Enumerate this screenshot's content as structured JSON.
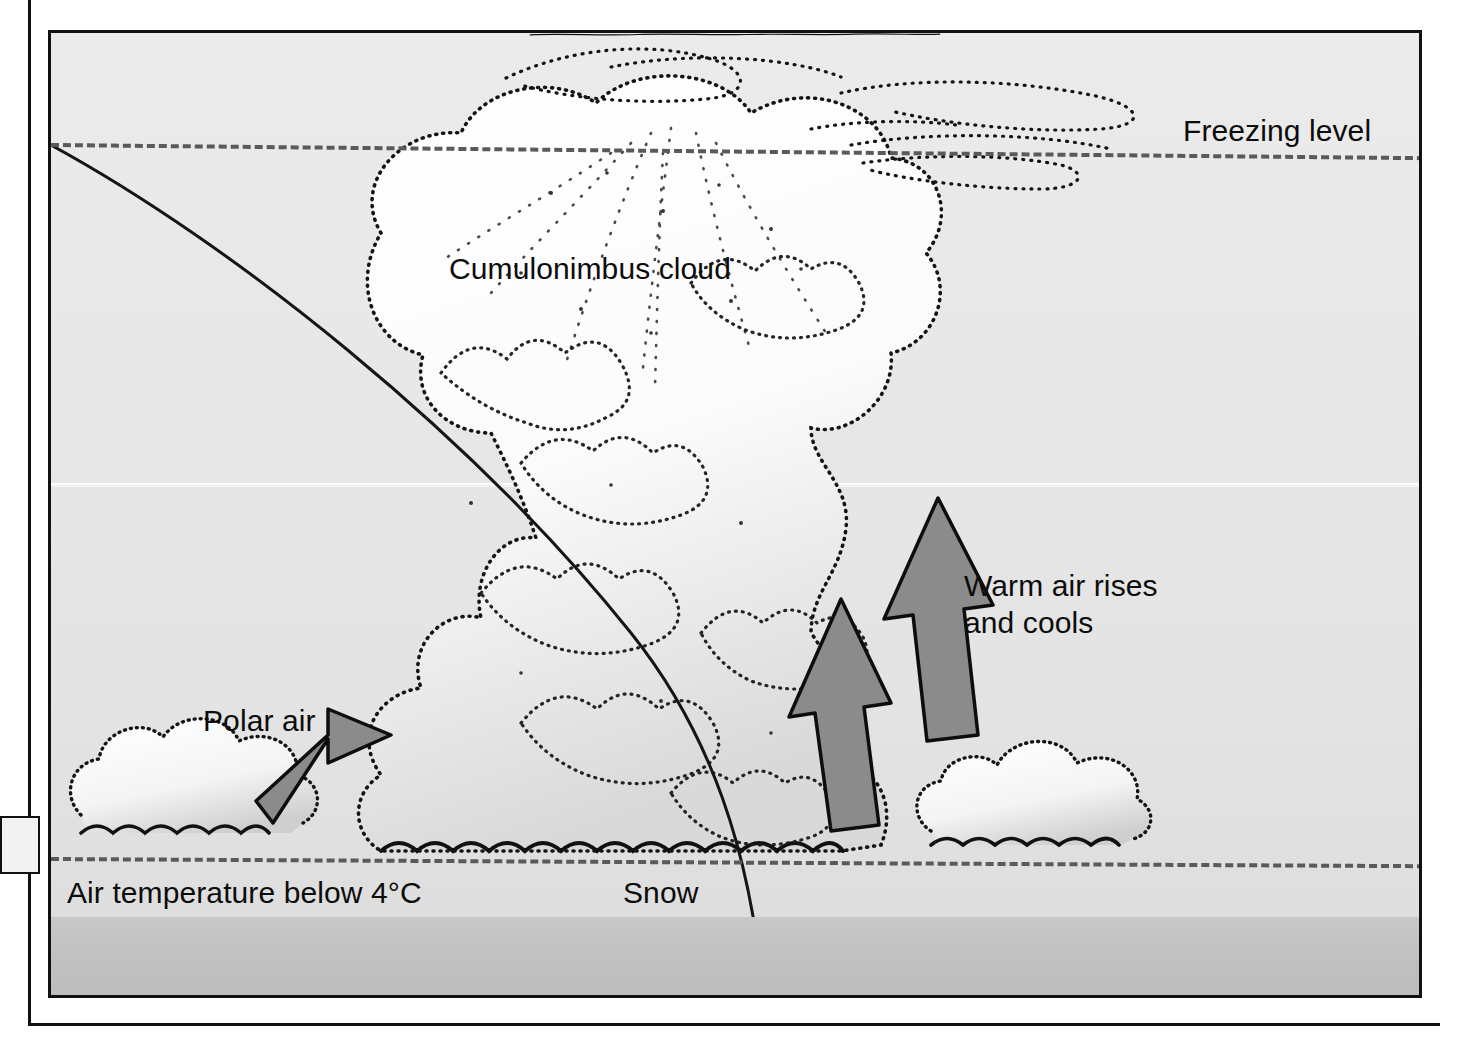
{
  "diagram": {
    "title_visible": false,
    "type": "weather-cross-section",
    "background_color": "#e7e7e7",
    "ground_color": "#c3c3c3",
    "arrow_color": "#8b8b8b",
    "line_color": "#151515"
  },
  "labels": {
    "freezing_level": "Freezing level",
    "cumulonimbus": "Cumulonimbus cloud",
    "warm_air_line1": "Warm air rises",
    "warm_air_line2": "and cools",
    "polar_air": "Polar air",
    "air_temperature": "Air temperature below 4°C",
    "snow": "Snow"
  },
  "features": {
    "freezing_level_line": "dashed",
    "surface_temperature_line": "dashed",
    "cold_front_line": "solid-curved",
    "cold_front_symbol": "triangular-barbs",
    "updraft_arrows": 2,
    "inflow_arrows": 1,
    "small_clouds": 2,
    "main_cloud": "cumulonimbus-with-anvil"
  }
}
